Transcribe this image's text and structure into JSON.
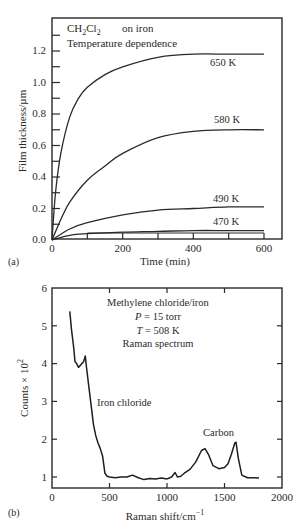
{
  "chart_data": [
    {
      "panel": "(a)",
      "type": "line",
      "title": "",
      "annotations": [
        "CH2Cl2",
        "on iron",
        "Temperature dependence"
      ],
      "xlabel": "Time (min)",
      "ylabel": "Film thickness/µm",
      "xlim": [
        0,
        650
      ],
      "ylim": [
        0,
        1.4
      ],
      "xticks": [
        0,
        200,
        400,
        600
      ],
      "yticks": [
        0.0,
        0.2,
        0.4,
        0.6,
        0.8,
        1.0,
        1.2
      ],
      "grid": false,
      "legend": "inline labels",
      "series": [
        {
          "name": "650 K",
          "x": [
            0,
            10,
            25,
            50,
            75,
            100,
            150,
            200,
            300,
            400,
            500,
            600
          ],
          "y": [
            0,
            0.3,
            0.55,
            0.78,
            0.9,
            0.97,
            1.05,
            1.1,
            1.16,
            1.18,
            1.18,
            1.18
          ]
        },
        {
          "name": "580 K",
          "x": [
            0,
            25,
            50,
            100,
            150,
            200,
            300,
            400,
            500,
            600
          ],
          "y": [
            0,
            0.13,
            0.24,
            0.38,
            0.47,
            0.55,
            0.65,
            0.69,
            0.7,
            0.7
          ]
        },
        {
          "name": "490 K",
          "x": [
            0,
            50,
            100,
            200,
            300,
            400,
            500,
            600
          ],
          "y": [
            0,
            0.07,
            0.11,
            0.16,
            0.19,
            0.2,
            0.21,
            0.21
          ]
        },
        {
          "name": "470 K",
          "x": [
            0,
            50,
            100,
            200,
            300,
            400,
            500,
            600
          ],
          "y": [
            0,
            0.03,
            0.04,
            0.05,
            0.055,
            0.06,
            0.06,
            0.06
          ]
        }
      ]
    },
    {
      "panel": "(b)",
      "type": "line",
      "title": "",
      "annotations": [
        "Methylene chloride/iron",
        "P = 15 torr",
        "T = 508 K",
        "Raman spectrum",
        "Iron chloride",
        "Carbon"
      ],
      "xlabel": "Raman shift/cm⁻¹",
      "ylabel": "Counts × 10²",
      "xlim": [
        0,
        2000
      ],
      "ylim": [
        0.7,
        6
      ],
      "xticks": [
        0,
        500,
        1000,
        1500,
        2000
      ],
      "yticks": [
        1,
        2,
        3,
        4,
        5,
        6
      ],
      "grid": false,
      "series": [
        {
          "name": "Raman spectrum",
          "x": [
            155,
            170,
            190,
            200,
            215,
            230,
            245,
            260,
            275,
            290,
            300,
            320,
            340,
            360,
            380,
            400,
            420,
            440,
            460,
            480,
            500,
            550,
            600,
            650,
            700,
            750,
            800,
            850,
            900,
            950,
            1000,
            1040,
            1070,
            1090,
            1120,
            1150,
            1200,
            1250,
            1300,
            1330,
            1360,
            1400,
            1450,
            1500,
            1530,
            1560,
            1590,
            1600,
            1620,
            1650,
            1700,
            1750,
            1800
          ],
          "y": [
            5.38,
            4.9,
            4.4,
            4.05,
            4.0,
            3.9,
            3.95,
            4.0,
            4.05,
            4.2,
            3.9,
            3.4,
            2.9,
            2.4,
            2.1,
            1.9,
            1.75,
            1.55,
            1.1,
            1.02,
            1.0,
            0.98,
            1.0,
            1.0,
            1.05,
            0.98,
            0.93,
            0.96,
            0.95,
            0.97,
            0.95,
            1.0,
            1.12,
            1.0,
            1.02,
            1.1,
            1.2,
            1.4,
            1.7,
            1.75,
            1.6,
            1.3,
            1.22,
            1.25,
            1.35,
            1.6,
            1.9,
            1.92,
            1.5,
            1.05,
            0.98,
            0.98,
            0.97
          ]
        }
      ]
    }
  ],
  "panel_a": {
    "label": "(a)",
    "formula_main": "CH",
    "formula_sub1": "2",
    "formula_mid": "Cl",
    "formula_sub2": "2",
    "substrate": "on iron",
    "subtitle": "Temperature dependence",
    "xlabel": "Time (min)",
    "ylabel": "Film thickness/µm",
    "xtick_labels": [
      "0",
      "200",
      "400",
      "600"
    ],
    "ytick_labels": [
      "0.0",
      "0.2",
      "0.4",
      "0.6",
      "0.8",
      "1.0",
      "1.2"
    ],
    "curve_labels": [
      "650 K",
      "580 K",
      "490 K",
      "470 K"
    ]
  },
  "panel_b": {
    "label": "(b)",
    "info_line1": "Methylene chloride/iron",
    "info_p_sym": "P",
    "info_p_val": " = 15 torr",
    "info_t_sym": "T",
    "info_t_val": " = 508 K",
    "info_line4": "Raman spectrum",
    "peak_label_1": "Iron chloride",
    "peak_label_2": "Carbon",
    "xlabel_main": "Raman shift/cm",
    "xlabel_sup": "−1",
    "ylabel_main": "Counts × 10",
    "ylabel_sup": "2",
    "xtick_labels": [
      "0",
      "500",
      "1000",
      "1500",
      "2000"
    ],
    "ytick_labels": [
      "1",
      "2",
      "3",
      "4",
      "5",
      "6"
    ]
  }
}
